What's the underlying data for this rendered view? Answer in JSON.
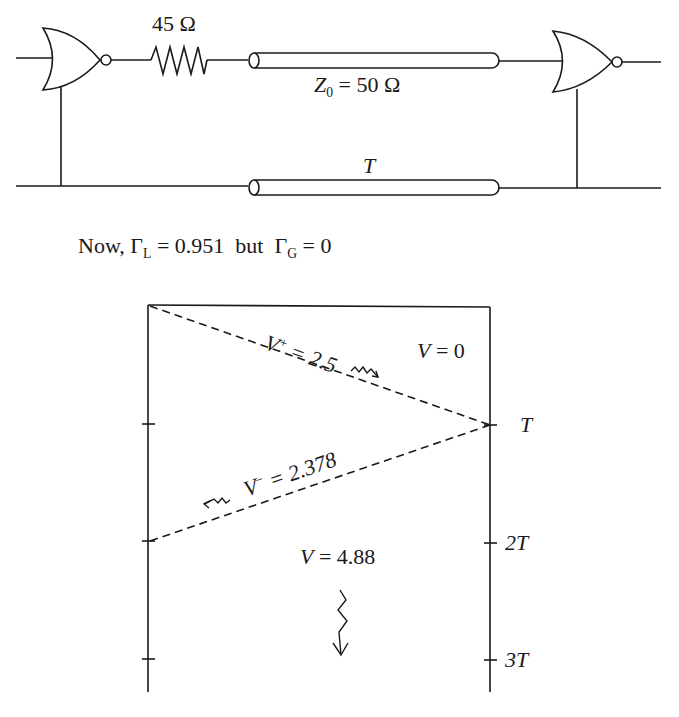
{
  "circuit": {
    "resistor_label": "45 Ω",
    "line_impedance": {
      "symbol": "Z",
      "subscript": "0",
      "value_text": " = 50 Ω"
    },
    "delay_label": "T"
  },
  "condition": {
    "prefix": "Now, ",
    "gamma_symbol": "Γ",
    "load_sub": "L",
    "load_value": " = 0.951",
    "connector": "  but  ",
    "gen_sub": "G",
    "gen_value": " = 0"
  },
  "bounce_diagram": {
    "forward_wave": {
      "symbol": "V",
      "sign": "+",
      "value": " = 2.5"
    },
    "initial_region": {
      "symbol": "V",
      "value": " = 0"
    },
    "reflected_wave": {
      "symbol": "V",
      "sign": "−",
      "value": " = 2.378"
    },
    "after_region": {
      "symbol": "V",
      "value": " = 4.88"
    },
    "time_ticks": [
      "T",
      "2T",
      "3T"
    ]
  },
  "colors": {
    "stroke": "#1a1a1a",
    "background": "#ffffff"
  }
}
